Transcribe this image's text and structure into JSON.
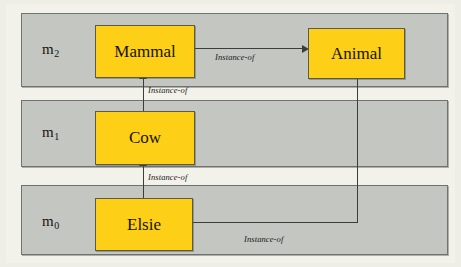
{
  "figure": {
    "colors": {
      "band_fill": "#c3c6c1",
      "band_border": "#6f726e",
      "node_fill": "#fdd017",
      "node_border": "#5d5a46",
      "connector": "#3b3d39",
      "page_background": "#efeee6"
    }
  },
  "levels": [
    {
      "id": "m2",
      "label": "m",
      "subscript": "2"
    },
    {
      "id": "m1",
      "label": "m",
      "subscript": "1"
    },
    {
      "id": "m0",
      "label": "m",
      "subscript": "0"
    }
  ],
  "nodes": [
    {
      "id": "mammal",
      "label": "Mammal",
      "level": "m2"
    },
    {
      "id": "animal",
      "label": "Animal",
      "level": "m2"
    },
    {
      "id": "cow",
      "label": "Cow",
      "level": "m1"
    },
    {
      "id": "elsie",
      "label": "Elsie",
      "level": "m0"
    }
  ],
  "edges": [
    {
      "id": "mammal-to-animal",
      "from": "mammal",
      "to": "animal",
      "label": "Instance-of"
    },
    {
      "id": "cow-to-mammal",
      "from": "cow",
      "to": "mammal",
      "label": "Instance-of"
    },
    {
      "id": "elsie-to-cow",
      "from": "elsie",
      "to": "cow",
      "label": "Instance-of"
    },
    {
      "id": "elsie-to-animal",
      "from": "elsie",
      "to": "animal",
      "label": "Instance-of"
    }
  ]
}
